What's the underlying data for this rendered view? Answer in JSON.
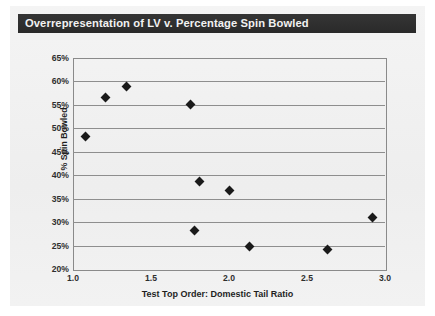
{
  "chart_data": {
    "type": "scatter",
    "title": "Overrepresentation of LV v. Percentage Spin Bowled",
    "xlabel": "Test Top Order: Domestic Tail Ratio",
    "ylabel": "% Spin Bowled",
    "xlim": [
      1.0,
      3.0
    ],
    "ylim": [
      20,
      65
    ],
    "xticks": [
      "1.0",
      "1.5",
      "2.0",
      "2.5",
      "3.0"
    ],
    "xtick_values": [
      1.0,
      1.5,
      2.0,
      2.5,
      3.0
    ],
    "yticks": [
      "20%",
      "25%",
      "30%",
      "35%",
      "40%",
      "45%",
      "50%",
      "55%",
      "60%",
      "65%"
    ],
    "ytick_values": [
      20,
      25,
      30,
      35,
      40,
      45,
      50,
      55,
      60,
      65
    ],
    "grid": "horizontal",
    "legend": null,
    "marker": "diamond",
    "marker_color": "#1a1a1a",
    "x": [
      1.08,
      1.21,
      1.34,
      1.75,
      1.78,
      1.81,
      2.0,
      2.13,
      2.63,
      2.92
    ],
    "y": [
      48.3,
      56.5,
      59.0,
      55.0,
      28.3,
      38.7,
      36.8,
      24.7,
      24.2,
      31.0
    ],
    "points": [
      {
        "x": 1.08,
        "y": 48.3
      },
      {
        "x": 1.21,
        "y": 56.5
      },
      {
        "x": 1.34,
        "y": 59.0
      },
      {
        "x": 1.75,
        "y": 55.0
      },
      {
        "x": 1.78,
        "y": 28.3
      },
      {
        "x": 1.81,
        "y": 38.7
      },
      {
        "x": 2.0,
        "y": 36.8
      },
      {
        "x": 2.13,
        "y": 24.7
      },
      {
        "x": 2.63,
        "y": 24.2
      },
      {
        "x": 2.92,
        "y": 31.0
      }
    ]
  },
  "figure": {
    "background_color": "#f1f1f1",
    "title_bar_color": "#2b2b2b",
    "title_text_color": "#f2f2f2",
    "gridline_color": "#8e8e8e",
    "frame_color": "#8a8a8a"
  }
}
